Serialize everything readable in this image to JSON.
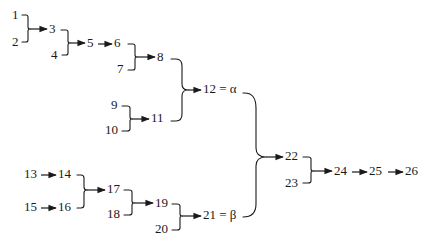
{
  "diagram": {
    "title": "",
    "nodes": [
      {
        "id": "1",
        "label": "1"
      },
      {
        "id": "2",
        "label": "2"
      },
      {
        "id": "3",
        "label": "3"
      },
      {
        "id": "4",
        "label": "4"
      },
      {
        "id": "5",
        "label": "5"
      },
      {
        "id": "6",
        "label": "6"
      },
      {
        "id": "7",
        "label": "7"
      },
      {
        "id": "8",
        "label": "8"
      },
      {
        "id": "9",
        "label": "9"
      },
      {
        "id": "10",
        "label": "10"
      },
      {
        "id": "11",
        "label": "11"
      },
      {
        "id": "12",
        "label": "12 = α"
      },
      {
        "id": "13",
        "label": "13"
      },
      {
        "id": "14",
        "label": "14"
      },
      {
        "id": "15",
        "label": "15"
      },
      {
        "id": "16",
        "label": "16"
      },
      {
        "id": "17",
        "label": "17"
      },
      {
        "id": "18",
        "label": "18"
      },
      {
        "id": "19",
        "label": "19"
      },
      {
        "id": "20",
        "label": "20"
      },
      {
        "id": "21",
        "label": "21 = β"
      },
      {
        "id": "22",
        "label": "22"
      },
      {
        "id": "23",
        "label": "23"
      },
      {
        "id": "24",
        "label": "24"
      },
      {
        "id": "25",
        "label": "25"
      },
      {
        "id": "26",
        "label": "26"
      }
    ],
    "edges": [
      {
        "from": [
          "1",
          "2"
        ],
        "to": "3",
        "type": "merge"
      },
      {
        "from": [
          "3",
          "4"
        ],
        "to": "5",
        "type": "merge"
      },
      {
        "from": [
          "5"
        ],
        "to": "6",
        "type": "arrow"
      },
      {
        "from": [
          "6",
          "7"
        ],
        "to": "8",
        "type": "merge"
      },
      {
        "from": [
          "9",
          "10"
        ],
        "to": "11",
        "type": "merge"
      },
      {
        "from": [
          "8",
          "11"
        ],
        "to": "12",
        "type": "merge"
      },
      {
        "from": [
          "13"
        ],
        "to": "14",
        "type": "arrow"
      },
      {
        "from": [
          "15"
        ],
        "to": "16",
        "type": "arrow"
      },
      {
        "from": [
          "14",
          "16"
        ],
        "to": "17",
        "type": "merge"
      },
      {
        "from": [
          "17",
          "18"
        ],
        "to": "19",
        "type": "merge"
      },
      {
        "from": [
          "19",
          "20"
        ],
        "to": "21",
        "type": "merge"
      },
      {
        "from": [
          "12",
          "21"
        ],
        "to": "22",
        "type": "merge"
      },
      {
        "from": [
          "22",
          "23"
        ],
        "to": "24",
        "type": "merge"
      },
      {
        "from": [
          "24"
        ],
        "to": "25",
        "type": "arrow"
      },
      {
        "from": [
          "25"
        ],
        "to": "26",
        "type": "arrow"
      }
    ]
  }
}
